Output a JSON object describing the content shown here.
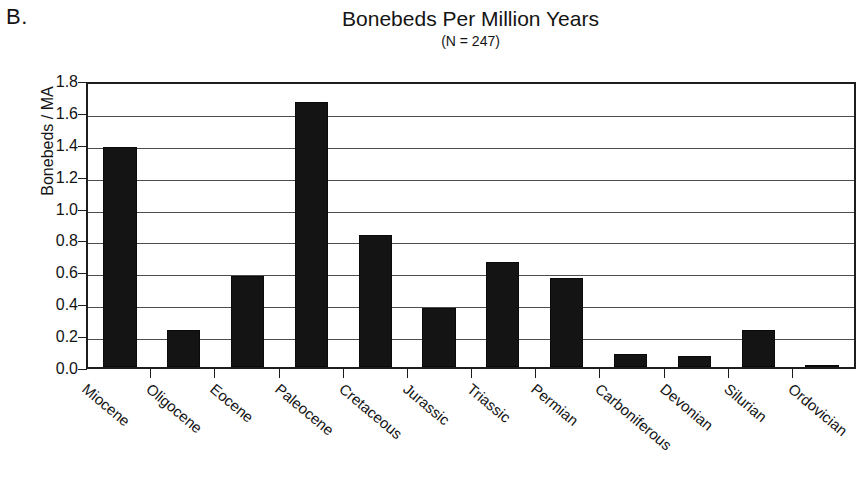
{
  "panel": {
    "letter": "B."
  },
  "header": {
    "title": "Bonebeds Per Million Years",
    "subtitle": "(N = 247)"
  },
  "chart_data": {
    "type": "bar",
    "title": "Bonebeds Per Million Years",
    "subtitle": "(N = 247)",
    "xlabel": "",
    "ylabel": "Bonebeds / MA",
    "ylim": [
      0.0,
      1.8
    ],
    "ytick_step": 0.2,
    "ytick_labels": [
      "0.0",
      "0.2",
      "0.4",
      "0.6",
      "0.8",
      "1.0",
      "1.2",
      "1.4",
      "1.6",
      "1.8"
    ],
    "grid": true,
    "legend": false,
    "bar_color": "#141414",
    "categories": [
      "Miocene",
      "Oligocene",
      "Eocene",
      "Paleocene",
      "Cretaceous",
      "Jurassic",
      "Triassic",
      "Permian",
      "Carboniferous",
      "Devonian",
      "Silurian",
      "Ordovician"
    ],
    "values": [
      1.38,
      0.23,
      0.57,
      1.66,
      0.83,
      0.37,
      0.66,
      0.56,
      0.08,
      0.07,
      0.23,
      0.01
    ]
  }
}
